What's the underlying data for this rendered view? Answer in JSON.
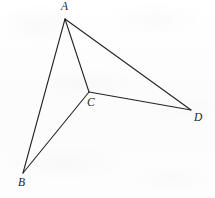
{
  "figure": {
    "kind": "geometry-diagram",
    "background_color": "#fdfdfd",
    "stroke_color": "#232323",
    "stroke_width": 1.1,
    "canvas": {
      "width": 215,
      "height": 198
    },
    "points": [
      {
        "id": "A",
        "label": "A",
        "x": 65,
        "y": 19,
        "label_x": 61,
        "label_y": 1
      },
      {
        "id": "B",
        "label": "B",
        "x": 23,
        "y": 173,
        "label_x": 18,
        "label_y": 177
      },
      {
        "id": "C",
        "label": "C",
        "x": 89,
        "y": 92,
        "label_x": 87,
        "label_y": 97
      },
      {
        "id": "D",
        "label": "D",
        "x": 191,
        "y": 110,
        "label_x": 194,
        "label_y": 112
      }
    ],
    "segments": [
      {
        "id": "AB",
        "from": "A",
        "to": "B"
      },
      {
        "id": "AC",
        "from": "A",
        "to": "C"
      },
      {
        "id": "AD",
        "from": "A",
        "to": "D"
      },
      {
        "id": "BC",
        "from": "B",
        "to": "C"
      },
      {
        "id": "CD",
        "from": "C",
        "to": "D"
      }
    ]
  }
}
